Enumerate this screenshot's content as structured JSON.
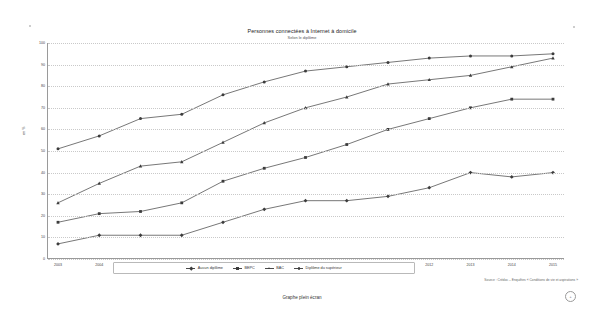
{
  "document": {
    "title": "Personnes connectées à Internet à domicile",
    "subtitle": "Selon le diplôme",
    "footer_caption": "Graphe plein écran",
    "footer_badge": "+",
    "source": "Source : Crédoc – Enquêtes « Conditions de vie et aspirations »"
  },
  "chart_data": {
    "type": "line",
    "title": "Personnes connectées à Internet à domicile",
    "subtitle": "Selon le diplôme",
    "xlabel": "",
    "ylabel": "en %",
    "categories": [
      "2003",
      "2004",
      "2005",
      "2006",
      "2007",
      "2008",
      "2009",
      "2010",
      "2011",
      "2012",
      "2013",
      "2014",
      "2015"
    ],
    "ylim": [
      0,
      100
    ],
    "yticks": [
      0,
      10,
      20,
      30,
      40,
      50,
      60,
      70,
      80,
      90,
      100
    ],
    "grid": true,
    "legend_position": "bottom",
    "series": [
      {
        "name": "Aucun diplôme",
        "marker": "diamond",
        "values": [
          7,
          11,
          11,
          11,
          17,
          23,
          27,
          27,
          29,
          33,
          40,
          38,
          40
        ]
      },
      {
        "name": "BEPC",
        "marker": "square",
        "values": [
          17,
          21,
          22,
          26,
          36,
          42,
          47,
          53,
          60,
          65,
          70,
          74,
          74
        ]
      },
      {
        "name": "BAC",
        "marker": "triangle",
        "values": [
          26,
          35,
          43,
          45,
          54,
          63,
          70,
          75,
          81,
          83,
          85,
          89,
          93
        ]
      },
      {
        "name": "Diplôme du supérieur",
        "marker": "circle",
        "values": [
          51,
          57,
          65,
          67,
          76,
          82,
          87,
          89,
          91,
          93,
          94,
          94,
          95
        ]
      }
    ]
  },
  "colors": {
    "line": "#3c3c3c",
    "grid": "#c9c9c9",
    "axis": "#9a9a9a",
    "text": "#333333"
  }
}
